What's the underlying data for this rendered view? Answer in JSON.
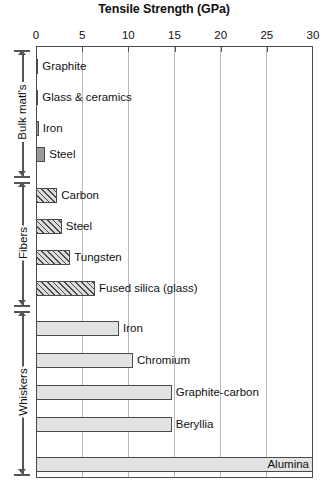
{
  "chart_data": {
    "type": "bar",
    "orientation": "horizontal",
    "title": "Tensile Strength (GPa)",
    "xlabel": "Tensile Strength (GPa)",
    "ylabel": "",
    "xlim": [
      0,
      30
    ],
    "xticks": [
      0,
      5,
      10,
      15,
      20,
      25,
      30
    ],
    "xtick_labels": [
      "0",
      "5",
      "10",
      "15",
      "20",
      "25",
      "30"
    ],
    "grid": true,
    "grid_axis": "x",
    "legend": false,
    "axis_position": "top",
    "categories": [
      "Graphite",
      "Glass & ceramics",
      "Iron",
      "Steel",
      "Carbon",
      "Steel",
      "Tungsten",
      "Fused silica (glass)",
      "Iron",
      "Chromium",
      "Graphite-carbon",
      "Beryllia",
      "Alumina"
    ],
    "values": [
      0.25,
      0.25,
      0.3,
      1.0,
      2.3,
      2.8,
      3.7,
      6.4,
      9.0,
      10.5,
      14.7,
      14.7,
      30.0
    ],
    "groups": [
      {
        "name": "Bulk matl's",
        "style": "solid-gray",
        "bars": [
          {
            "label": "Graphite",
            "value": 0.25,
            "label_inside": false
          },
          {
            "label": "Glass & ceramics",
            "value": 0.25,
            "label_inside": false
          },
          {
            "label": "Iron",
            "value": 0.3,
            "label_inside": false
          },
          {
            "label": "Steel",
            "value": 1.0,
            "label_inside": false
          }
        ]
      },
      {
        "name": "Fibers",
        "style": "hatched",
        "bars": [
          {
            "label": "Carbon",
            "value": 2.3,
            "label_inside": false
          },
          {
            "label": "Steel",
            "value": 2.8,
            "label_inside": false
          },
          {
            "label": "Tungsten",
            "value": 3.7,
            "label_inside": false
          },
          {
            "label": "Fused silica (glass)",
            "value": 6.4,
            "label_inside": false
          }
        ]
      },
      {
        "name": "Whiskers",
        "style": "light-gray",
        "bars": [
          {
            "label": "Iron",
            "value": 9.0,
            "label_inside": false
          },
          {
            "label": "Chromium",
            "value": 10.5,
            "label_inside": false
          },
          {
            "label": "Graphite-carbon",
            "value": 14.7,
            "label_inside": false
          },
          {
            "label": "Beryllia",
            "value": 14.7,
            "label_inside": false
          },
          {
            "label": "Alumina",
            "value": 30.0,
            "label_inside": true
          }
        ]
      }
    ],
    "colors": {
      "bulk_fill": "#9a9a9a",
      "fiber_fill": "#dcdcdc",
      "fiber_hatch": "#4a4a4a",
      "whisker_fill": "#e2e2e2",
      "bar_border": "#4a4a4a",
      "grid": "#b9b9b9",
      "axis": "#4a4a4a",
      "text": "#111111",
      "background": "#ffffff"
    }
  }
}
